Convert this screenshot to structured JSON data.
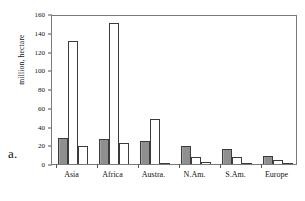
{
  "figure": {
    "panel_letter": "a.",
    "frame": true
  },
  "chart_data": {
    "type": "bar",
    "title": "",
    "xlabel": "",
    "ylabel": "million, hectare",
    "ylim": [
      0,
      160
    ],
    "ytick_step": 20,
    "yticks": [
      0,
      20,
      40,
      60,
      80,
      100,
      120,
      140,
      160
    ],
    "ytick_labels": [
      "0",
      "20",
      "40",
      "60",
      "80",
      "100",
      "120",
      "140",
      "160"
    ],
    "grid": false,
    "legend": "none",
    "categories": [
      "Asia",
      "Africa",
      "Austra.",
      "N.Am.",
      "S.Am.",
      "Europe"
    ],
    "series": [
      {
        "name": "series-1",
        "fill": "dark-hatch",
        "color": "#8f8f8f",
        "values": [
          28,
          27,
          25,
          19,
          16,
          9
        ]
      },
      {
        "name": "series-2",
        "fill": "white",
        "color": "#ffffff",
        "values": [
          131,
          150,
          48,
          7,
          7,
          4
        ]
      },
      {
        "name": "series-3",
        "fill": "dotted",
        "color": "#ffffff",
        "values": [
          19,
          22,
          1,
          2,
          0.5,
          0.5
        ]
      }
    ]
  }
}
